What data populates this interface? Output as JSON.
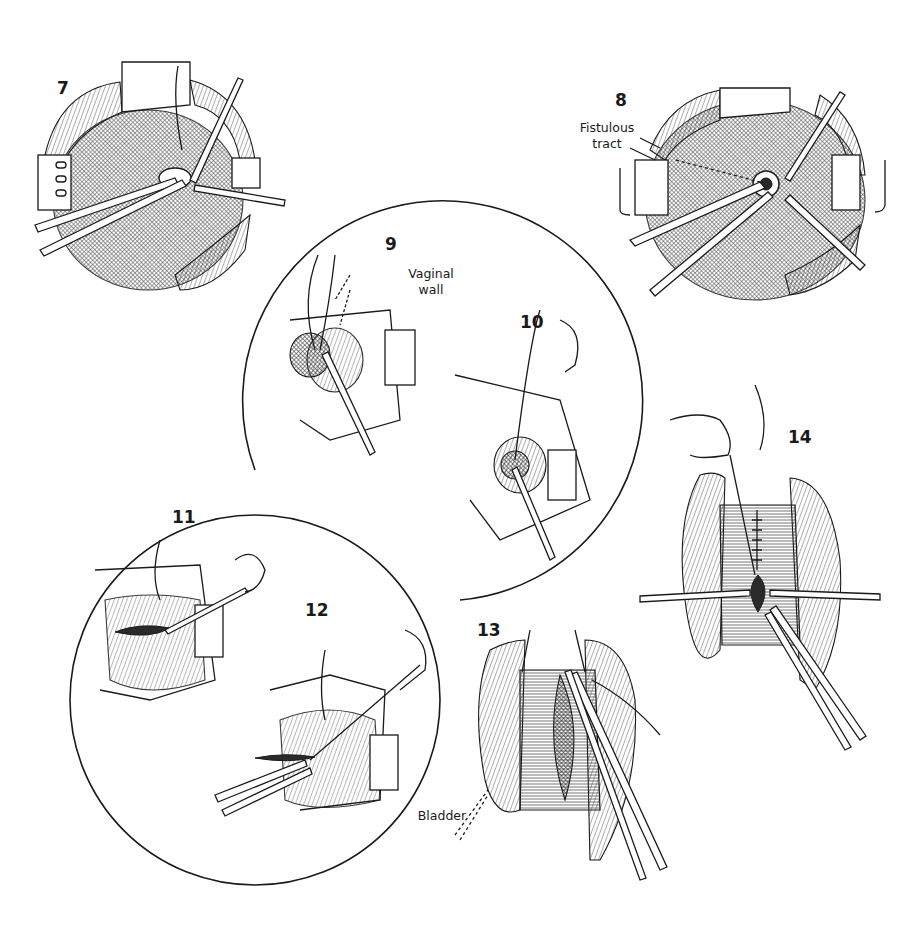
{
  "figure": {
    "panels": [
      {
        "id": "7",
        "label": "7"
      },
      {
        "id": "8",
        "label": "8",
        "annotations": [
          {
            "text_line1": "Fistulous",
            "text_line2": "tract"
          }
        ]
      },
      {
        "id": "9",
        "label": "9",
        "annotations": [
          {
            "text_line1": "Vaginal",
            "text_line2": "wall"
          }
        ]
      },
      {
        "id": "10",
        "label": "10"
      },
      {
        "id": "11",
        "label": "11"
      },
      {
        "id": "12",
        "label": "12"
      },
      {
        "id": "13",
        "label": "13",
        "annotations": [
          {
            "text_line1": "Bladder"
          }
        ]
      },
      {
        "id": "14",
        "label": "14"
      }
    ]
  },
  "colors": {
    "ink": "#1a1a1a",
    "background": "#ffffff"
  }
}
